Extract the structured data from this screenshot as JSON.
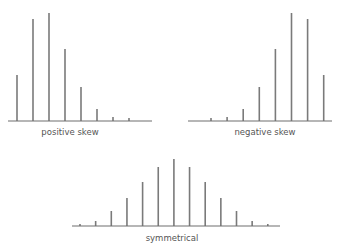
{
  "chart_data": [
    {
      "type": "bar",
      "id": "positive",
      "title": "positive skew",
      "categories": [
        "1",
        "2",
        "3",
        "4",
        "5",
        "6",
        "7",
        "8"
      ],
      "values": [
        46,
        102,
        108,
        72,
        34,
        12,
        4,
        3
      ],
      "ylim": [
        0,
        110
      ],
      "xlabel": "positive skew",
      "ylabel": "",
      "grid": false
    },
    {
      "type": "bar",
      "id": "negative",
      "title": "negative skew",
      "categories": [
        "1",
        "2",
        "3",
        "4",
        "5",
        "6",
        "7",
        "8"
      ],
      "values": [
        3,
        4,
        12,
        34,
        72,
        108,
        102,
        46
      ],
      "ylim": [
        0,
        110
      ],
      "xlabel": "negative skew",
      "ylabel": "",
      "grid": false
    },
    {
      "type": "bar",
      "id": "symmetrical",
      "title": "symmetrical",
      "categories": [
        "1",
        "2",
        "3",
        "4",
        "5",
        "6",
        "7",
        "8",
        "9",
        "10",
        "11",
        "12",
        "13"
      ],
      "values": [
        2,
        5,
        15,
        28,
        44,
        59,
        67,
        59,
        44,
        28,
        15,
        5,
        2
      ],
      "ylim": [
        0,
        110
      ],
      "xlabel": "symmetrical",
      "ylabel": "",
      "grid": false
    }
  ],
  "colors": {
    "bar": "#7a7a7a",
    "axis": "#6e6e6e",
    "label": "#555555"
  }
}
